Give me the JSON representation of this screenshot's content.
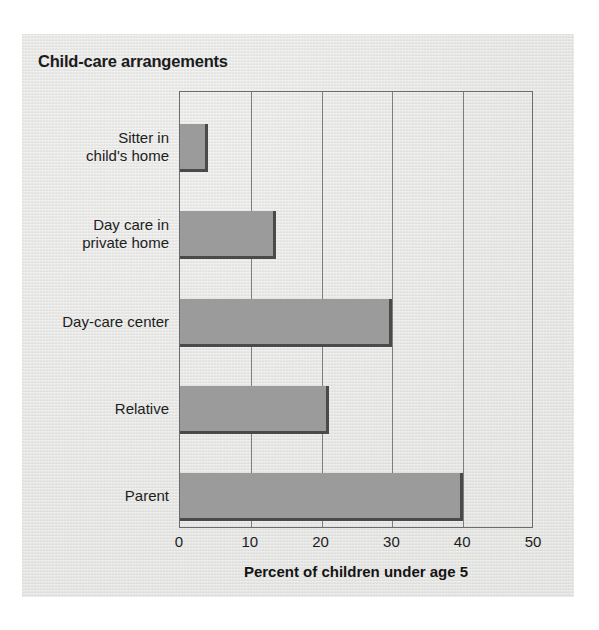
{
  "figure": {
    "title": "Child-care arrangements",
    "x_axis_title": "Percent of children under age 5",
    "panel_color": "#e7e7e5",
    "bar_color": "#9b9b9b",
    "bar_shadow_color": "#4a4a4a",
    "axis_color": "#6c6c6c",
    "text_color": "#1d1d1d"
  },
  "chart_data": {
    "type": "bar",
    "orientation": "horizontal",
    "title": "Child-care arrangements",
    "xlabel": "Percent of children under age 5",
    "ylabel": "",
    "categories": [
      "Sitter in\nchild's home",
      "Day care in\nprivate home",
      "Day-care center",
      "Relative",
      "Parent"
    ],
    "category_labels": [
      [
        "Sitter in",
        "child's home"
      ],
      [
        "Day care in",
        "private home"
      ],
      [
        "Day-care center"
      ],
      [
        "Relative"
      ],
      [
        "Parent"
      ]
    ],
    "values": [
      4,
      13.5,
      30,
      21,
      40
    ],
    "xlim": [
      0,
      50
    ],
    "xticks": [
      0,
      10,
      20,
      30,
      40,
      50
    ],
    "xtick_labels": [
      "0",
      "10",
      "20",
      "30",
      "40",
      "50"
    ],
    "grid": "vertical",
    "legend": "none"
  }
}
